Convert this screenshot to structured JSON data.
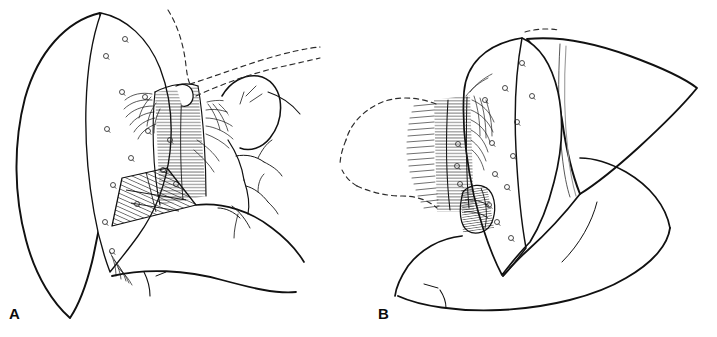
{
  "figure": {
    "kind": "scientific-line-illustration",
    "background_color": "#ffffff",
    "ink_color": "#111111",
    "width": 717,
    "height": 337
  },
  "panels": [
    {
      "id": "A",
      "label": "A",
      "label_x": 9,
      "label_y": 306,
      "description": "Lateral view, left specimen: broad rounded lobe overlying an elongate valve, a transversely striated band, a hatched wedge, and branched setose process; dashed reference outlines trail to the upper right.",
      "features": [
        "outer-rounded-lobe",
        "inner-elongate-valve",
        "setal-socket-row",
        "striated-band",
        "hatched-wedge",
        "branched-setose-process",
        "dashed-reference-outline",
        "basal-ring-margin"
      ]
    },
    {
      "id": "B",
      "label": "B",
      "label_x": 378,
      "label_y": 306,
      "description": "Lateral view, right specimen: pointed triangular blade directed to the right, an ovate setose valve, finely hatched knob, striated connective band, and a dashed lobe outline to the left.",
      "features": [
        "pointed-triangular-blade",
        "ovate-setose-valve",
        "setal-socket-row",
        "striated-connective-band",
        "hatched-knob",
        "dashed-lobe-outline",
        "basal-ring-margin"
      ]
    }
  ],
  "style": {
    "outline_stroke_width": 1.9,
    "detail_stroke_width": 0.85,
    "hatch_stroke_width": 0.6,
    "dash_pattern": "5 4",
    "socket_radius": 2.6
  },
  "legend": {
    "has_legend": false,
    "has_scale_bar": false,
    "has_axis": false,
    "caption_text": ""
  }
}
